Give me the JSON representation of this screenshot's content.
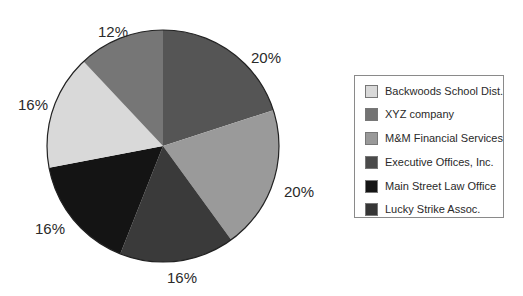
{
  "chart_data": {
    "type": "pie",
    "title": "",
    "start_angle_deg": 0,
    "direction": "clockwise",
    "legend_position": "right",
    "slices": [
      {
        "label": "Executive Offices, Inc.",
        "value": 20,
        "display": "20%",
        "color": "#555555"
      },
      {
        "label": "M&M Financial Services",
        "value": 20,
        "display": "20%",
        "color": "#9a9a9a"
      },
      {
        "label": "Lucky Strike Assoc.",
        "value": 16,
        "display": "16%",
        "color": "#3a3a3a"
      },
      {
        "label": "Main Street Law Office",
        "value": 16,
        "display": "16%",
        "color": "#141414"
      },
      {
        "label": "Backwoods School Dist.",
        "value": 16,
        "display": "16%",
        "color": "#d9d9d9"
      },
      {
        "label": "XYZ company",
        "value": 12,
        "display": "12%",
        "color": "#767676"
      }
    ],
    "categories": [
      "Executive Offices, Inc.",
      "M&M Financial Services",
      "Lucky Strike Assoc.",
      "Main Street Law Office",
      "Backwoods School Dist.",
      "XYZ company"
    ],
    "values": [
      20,
      20,
      16,
      16,
      16,
      12
    ]
  },
  "labels": {
    "executive": "20%",
    "mm": "20%",
    "lucky": "16%",
    "main_street": "16%",
    "backwoods": "16%",
    "xyz": "12%"
  },
  "legend": {
    "items": [
      {
        "label": "Backwoods School Dist.",
        "color": "#d9d9d9"
      },
      {
        "label": "XYZ company",
        "color": "#737373"
      },
      {
        "label": "M&M Financial Services",
        "color": "#999999"
      },
      {
        "label": "Executive Offices, Inc.",
        "color": "#4a4a4a"
      },
      {
        "label": "Main Street Law Office",
        "color": "#141414"
      },
      {
        "label": "Lucky Strike Assoc.",
        "color": "#363636"
      }
    ]
  }
}
